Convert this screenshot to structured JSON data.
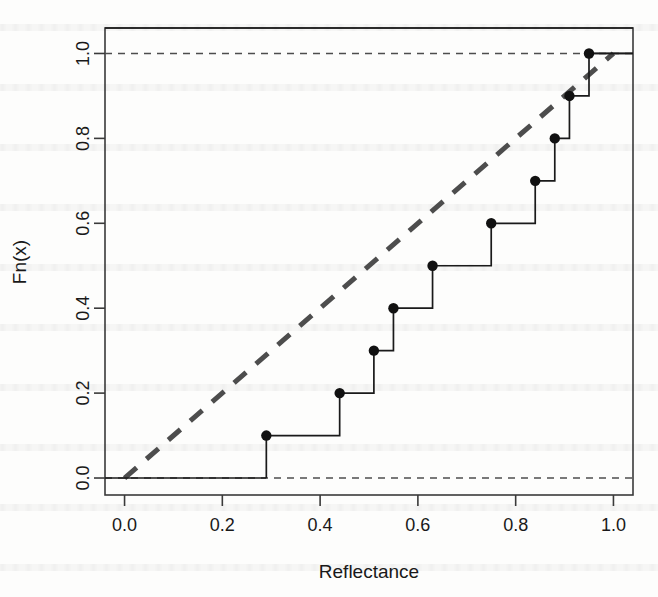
{
  "chart_data": {
    "type": "line",
    "title": "",
    "subtitle": "",
    "xlabel": "Reflectance",
    "ylabel": "Fn(x)",
    "xlim": [
      -0.04,
      1.04
    ],
    "ylim": [
      -0.04,
      1.06
    ],
    "grid": false,
    "legend": "none",
    "xticks": [
      0.0,
      0.2,
      0.4,
      0.6,
      0.8,
      1.0
    ],
    "xtick_labels": [
      "0.0",
      "0.2",
      "0.4",
      "0.6",
      "0.8",
      "1.0"
    ],
    "yticks": [
      0.0,
      0.2,
      0.4,
      0.6,
      0.8,
      1.0
    ],
    "ytick_labels": [
      "0.0",
      "0.2",
      "0.4",
      "0.6",
      "0.8",
      "1.0"
    ],
    "series": [
      {
        "name": "Empirical CDF",
        "style": "step-post-with-points",
        "x": [
          0.29,
          0.44,
          0.51,
          0.55,
          0.63,
          0.75,
          0.84,
          0.88,
          0.91,
          0.95
        ],
        "y": [
          0.1,
          0.2,
          0.3,
          0.4,
          0.5,
          0.6,
          0.7,
          0.8,
          0.9,
          1.0
        ]
      },
      {
        "name": "Reference uniform CDF",
        "style": "dashed-diagonal",
        "x": [
          0.0,
          1.0
        ],
        "y": [
          0.0,
          1.0
        ]
      },
      {
        "name": "Lower reference level",
        "style": "dashed-horizontal",
        "x": [
          -0.04,
          1.04
        ],
        "y": [
          0.0,
          0.0
        ]
      },
      {
        "name": "Upper reference level",
        "style": "dashed-horizontal",
        "x": [
          -0.04,
          1.04
        ],
        "y": [
          1.0,
          1.0
        ]
      }
    ],
    "colors": {
      "line": "#1a1a1a",
      "point": "#111111",
      "reference": "#4d4d4d",
      "axis": "#3a3a3a",
      "background": "#fdfdfc"
    }
  },
  "figure": {
    "x_axis_title": "Reflectance",
    "y_axis_title": "Fn(x)"
  }
}
